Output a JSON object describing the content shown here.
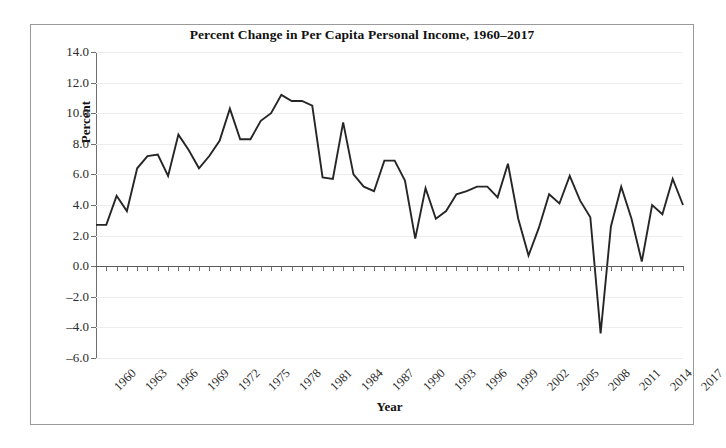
{
  "chart_data": {
    "type": "line",
    "title": "Percent Change in Per Capita Personal Income, 1960–2017",
    "xlabel": "Year",
    "ylabel": "Percent",
    "ylim": [
      -6.0,
      14.0
    ],
    "ytick_step": 2.0,
    "ytick_labels": [
      "14.0",
      "12.0",
      "10.0",
      "8.0",
      "6.0",
      "4.0",
      "2.0",
      "0.0",
      "–2.0",
      "–4.0",
      "–6.0"
    ],
    "ytick_values": [
      14.0,
      12.0,
      10.0,
      8.0,
      6.0,
      4.0,
      2.0,
      0.0,
      -2.0,
      -4.0,
      -6.0
    ],
    "xlim": [
      1960,
      2017
    ],
    "xtick_labels": [
      "1960",
      "1963",
      "1966",
      "1969",
      "1972",
      "1975",
      "1978",
      "1981",
      "1984",
      "1987",
      "1990",
      "1993",
      "1996",
      "1999",
      "2002",
      "2005",
      "2008",
      "2011",
      "2014",
      "2017"
    ],
    "xtick_label_step": 3,
    "grid": true,
    "legend": null,
    "line_color": "#262626",
    "x": [
      1960,
      1961,
      1962,
      1963,
      1964,
      1965,
      1966,
      1967,
      1968,
      1969,
      1970,
      1971,
      1972,
      1973,
      1974,
      1975,
      1976,
      1977,
      1978,
      1979,
      1980,
      1981,
      1982,
      1983,
      1984,
      1985,
      1986,
      1987,
      1988,
      1989,
      1990,
      1991,
      1992,
      1993,
      1994,
      1995,
      1996,
      1997,
      1998,
      1999,
      2000,
      2001,
      2002,
      2003,
      2004,
      2005,
      2006,
      2007,
      2008,
      2009,
      2010,
      2011,
      2012,
      2013,
      2014,
      2015,
      2016,
      2017
    ],
    "values": [
      2.7,
      2.7,
      4.6,
      3.6,
      6.4,
      7.2,
      7.3,
      5.9,
      8.6,
      7.6,
      6.4,
      7.2,
      8.2,
      10.3,
      8.3,
      8.3,
      9.5,
      10.0,
      11.2,
      10.8,
      10.8,
      10.5,
      5.8,
      5.7,
      9.4,
      6.0,
      5.2,
      4.9,
      6.9,
      6.9,
      5.6,
      1.8,
      5.1,
      3.1,
      3.6,
      4.7,
      4.9,
      5.2,
      5.2,
      4.5,
      6.7,
      3.1,
      0.7,
      2.5,
      4.7,
      4.1,
      5.9,
      4.3,
      3.2,
      -4.4,
      2.6,
      5.2,
      3.1,
      0.3,
      4.0,
      3.4,
      5.7,
      4.0
    ]
  }
}
